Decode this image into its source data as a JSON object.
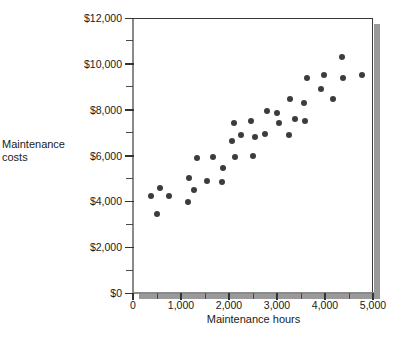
{
  "chart_data": {
    "type": "scatter",
    "title": "",
    "xlabel": "Maintenance hours",
    "ylabel": "Maintenance costs",
    "ylabel_line1": "Maintenance",
    "ylabel_line2": "costs",
    "xlim": [
      0,
      5000
    ],
    "ylim": [
      0,
      12000
    ],
    "grid": false,
    "legend": null,
    "x_ticks": [
      0,
      1000,
      2000,
      3000,
      4000,
      5000
    ],
    "x_tick_labels": [
      "0",
      "1,000",
      "2,000",
      "3,000",
      "4,000",
      "5,000"
    ],
    "x_minor_ticks": [
      500,
      1500,
      2500,
      3500,
      4500
    ],
    "y_ticks": [
      0,
      2000,
      4000,
      6000,
      8000,
      10000,
      12000
    ],
    "y_tick_labels": [
      "$0",
      "$2,000",
      "$4,000",
      "$6,000",
      "$8,000",
      "$10,000",
      "$12,000"
    ],
    "y_minor_ticks": [
      1000,
      3000,
      5000,
      7000,
      9000,
      11000
    ],
    "marker": "filled-circle",
    "marker_color": "#3c3c3c",
    "marker_size": 6,
    "points": [
      {
        "x": 380,
        "y": 4250
      },
      {
        "x": 500,
        "y": 3450
      },
      {
        "x": 560,
        "y": 4600
      },
      {
        "x": 740,
        "y": 4250
      },
      {
        "x": 1140,
        "y": 3950
      },
      {
        "x": 1160,
        "y": 5000
      },
      {
        "x": 1270,
        "y": 4500
      },
      {
        "x": 1340,
        "y": 5900
      },
      {
        "x": 1540,
        "y": 4900
      },
      {
        "x": 1660,
        "y": 5950
      },
      {
        "x": 1850,
        "y": 4850
      },
      {
        "x": 1870,
        "y": 5450
      },
      {
        "x": 2070,
        "y": 6650
      },
      {
        "x": 2110,
        "y": 7400
      },
      {
        "x": 2120,
        "y": 5950
      },
      {
        "x": 2260,
        "y": 6900
      },
      {
        "x": 2450,
        "y": 7500
      },
      {
        "x": 2490,
        "y": 6000
      },
      {
        "x": 2550,
        "y": 6800
      },
      {
        "x": 2760,
        "y": 6950
      },
      {
        "x": 2790,
        "y": 7950
      },
      {
        "x": 2990,
        "y": 7850
      },
      {
        "x": 3050,
        "y": 7400
      },
      {
        "x": 3240,
        "y": 6900
      },
      {
        "x": 3280,
        "y": 8450
      },
      {
        "x": 3380,
        "y": 7600
      },
      {
        "x": 3560,
        "y": 8300
      },
      {
        "x": 3590,
        "y": 7500
      },
      {
        "x": 3620,
        "y": 9400
      },
      {
        "x": 3920,
        "y": 8900
      },
      {
        "x": 3980,
        "y": 9500
      },
      {
        "x": 4160,
        "y": 8450
      },
      {
        "x": 4360,
        "y": 10300
      },
      {
        "x": 4380,
        "y": 9400
      },
      {
        "x": 4770,
        "y": 9500
      }
    ]
  }
}
